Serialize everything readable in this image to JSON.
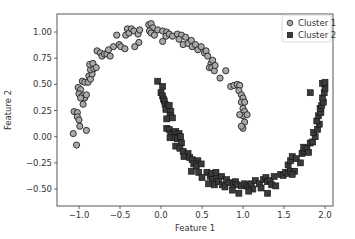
{
  "chart_data": {
    "type": "scatter",
    "title": "",
    "xlabel": "Feature 1",
    "ylabel": "Feature 2",
    "xlim": [
      -1.22,
      2.1
    ],
    "ylim": [
      -0.65,
      1.15
    ],
    "xticks": [
      -1.0,
      -0.5,
      0.0,
      0.5,
      1.0,
      1.5,
      2.0
    ],
    "xtick_labels": [
      "−1.0",
      "−0.5",
      "0.0",
      "0.5",
      "1.0",
      "1.5",
      "2.0"
    ],
    "yticks": [
      1.0,
      0.75,
      0.5,
      0.25,
      0.0,
      -0.25,
      -0.5
    ],
    "ytick_labels": [
      "1.00",
      "0.75",
      "0.50",
      "0.25",
      "0.00",
      "−0.25",
      "−0.50"
    ],
    "grid": false,
    "legend_position": "upper right",
    "series": [
      {
        "name": "Cluster 1",
        "marker": "circle",
        "color": "#a9a9a9",
        "edgecolor": "#222222",
        "points": [
          [
            -1.06,
            0.24
          ],
          [
            -1.02,
            0.23
          ],
          [
            -1.02,
            0.19
          ],
          [
            -1.0,
            0.16
          ],
          [
            -0.99,
            0.1
          ],
          [
            -1.07,
            0.03
          ],
          [
            -1.03,
            -0.08
          ],
          [
            -0.91,
            0.06
          ],
          [
            -1.01,
            0.47
          ],
          [
            -0.98,
            0.45
          ],
          [
            -1.0,
            0.41
          ],
          [
            -0.96,
            0.39
          ],
          [
            -0.93,
            0.37
          ],
          [
            -0.98,
            0.37
          ],
          [
            -0.91,
            0.4
          ],
          [
            -0.95,
            0.31
          ],
          [
            -0.96,
            0.53
          ],
          [
            -0.93,
            0.52
          ],
          [
            -0.89,
            0.52
          ],
          [
            -0.88,
            0.58
          ],
          [
            -0.86,
            0.55
          ],
          [
            -0.84,
            0.6
          ],
          [
            -0.86,
            0.64
          ],
          [
            -0.82,
            0.65
          ],
          [
            -0.87,
            0.69
          ],
          [
            -0.83,
            0.7
          ],
          [
            -0.79,
            0.66
          ],
          [
            -0.78,
            0.82
          ],
          [
            -0.74,
            0.8
          ],
          [
            -0.72,
            0.77
          ],
          [
            -0.69,
            0.79
          ],
          [
            -0.66,
            0.79
          ],
          [
            -0.64,
            0.83
          ],
          [
            -0.62,
            0.77
          ],
          [
            -0.58,
            0.86
          ],
          [
            -0.54,
            0.97
          ],
          [
            -0.51,
            0.88
          ],
          [
            -0.49,
            0.86
          ],
          [
            -0.44,
            0.84
          ],
          [
            -0.43,
            0.97
          ],
          [
            -0.41,
            1.03
          ],
          [
            -0.39,
            0.99
          ],
          [
            -0.36,
            1.03
          ],
          [
            -0.33,
            1.01
          ],
          [
            -0.28,
            0.98
          ],
          [
            -0.26,
            1.02
          ],
          [
            -0.27,
            0.9
          ],
          [
            -0.32,
            0.86
          ],
          [
            -0.15,
            1.07
          ],
          [
            -0.12,
            1.08
          ],
          [
            -0.1,
            1.04
          ],
          [
            -0.14,
            1.01
          ],
          [
            -0.12,
            0.99
          ],
          [
            -0.08,
            0.97
          ],
          [
            -0.04,
            1.02
          ],
          [
            0.02,
            1.01
          ],
          [
            0.07,
            1.0
          ],
          [
            0.06,
            0.96
          ],
          [
            0.02,
            0.91
          ],
          [
            0.1,
            0.98
          ],
          [
            0.14,
            0.96
          ],
          [
            0.2,
            0.98
          ],
          [
            0.25,
            0.97
          ],
          [
            0.3,
            0.95
          ],
          [
            0.22,
            0.93
          ],
          [
            0.27,
            0.88
          ],
          [
            0.33,
            0.89
          ],
          [
            0.37,
            0.92
          ],
          [
            0.38,
            0.86
          ],
          [
            0.42,
            0.88
          ],
          [
            0.45,
            0.83
          ],
          [
            0.49,
            0.86
          ],
          [
            0.53,
            0.8
          ],
          [
            0.55,
            0.82
          ],
          [
            0.57,
            0.77
          ],
          [
            0.61,
            0.7
          ],
          [
            0.63,
            0.73
          ],
          [
            0.59,
            0.66
          ],
          [
            0.62,
            0.66
          ],
          [
            0.65,
            0.63
          ],
          [
            0.66,
            0.68
          ],
          [
            0.72,
            0.56
          ],
          [
            0.79,
            0.63
          ],
          [
            0.85,
            0.48
          ],
          [
            0.89,
            0.49
          ],
          [
            0.93,
            0.5
          ],
          [
            0.96,
            0.49
          ],
          [
            0.95,
            0.44
          ],
          [
            0.98,
            0.4
          ],
          [
            1.0,
            0.37
          ],
          [
            0.98,
            0.33
          ],
          [
            1.02,
            0.33
          ],
          [
            1.0,
            0.27
          ],
          [
            1.02,
            0.24
          ],
          [
            1.0,
            0.2
          ],
          [
            0.96,
            0.21
          ],
          [
            1.02,
            0.14
          ],
          [
            1.05,
            0.21
          ],
          [
            1.0,
            0.08
          ],
          [
            0.98,
            0.1
          ]
        ]
      },
      {
        "name": "Cluster 2",
        "marker": "square",
        "color": "#3a3a3a",
        "edgecolor": "#111111",
        "points": [
          [
            -0.04,
            0.53
          ],
          [
            0.02,
            0.48
          ],
          [
            0.0,
            0.42
          ],
          [
            0.02,
            0.39
          ],
          [
            0.03,
            0.36
          ],
          [
            0.04,
            0.34
          ],
          [
            0.05,
            0.31
          ],
          [
            0.08,
            0.29
          ],
          [
            0.06,
            0.26
          ],
          [
            0.1,
            0.3
          ],
          [
            0.12,
            0.24
          ],
          [
            0.11,
            0.2
          ],
          [
            0.07,
            0.17
          ],
          [
            0.14,
            0.18
          ],
          [
            0.07,
            0.08
          ],
          [
            0.1,
            0.07
          ],
          [
            0.15,
            0.04
          ],
          [
            0.12,
            0.02
          ],
          [
            0.18,
            0.05
          ],
          [
            0.22,
            0.03
          ],
          [
            0.11,
            -0.01
          ],
          [
            0.17,
            -0.01
          ],
          [
            0.2,
            -0.02
          ],
          [
            0.24,
            0.0
          ],
          [
            0.25,
            -0.06
          ],
          [
            0.18,
            -0.09
          ],
          [
            0.23,
            -0.11
          ],
          [
            0.27,
            -0.14
          ],
          [
            0.33,
            -0.16
          ],
          [
            0.28,
            -0.19
          ],
          [
            0.35,
            -0.2
          ],
          [
            0.38,
            -0.22
          ],
          [
            0.45,
            -0.23
          ],
          [
            0.4,
            -0.26
          ],
          [
            0.43,
            -0.28
          ],
          [
            0.49,
            -0.26
          ],
          [
            0.37,
            -0.33
          ],
          [
            0.46,
            -0.34
          ],
          [
            0.56,
            -0.34
          ],
          [
            0.5,
            -0.39
          ],
          [
            0.6,
            -0.38
          ],
          [
            0.63,
            -0.41
          ],
          [
            0.62,
            -0.35
          ],
          [
            0.68,
            -0.4
          ],
          [
            0.67,
            -0.34
          ],
          [
            0.74,
            -0.38
          ],
          [
            0.58,
            -0.45
          ],
          [
            0.65,
            -0.46
          ],
          [
            0.7,
            -0.43
          ],
          [
            0.75,
            -0.46
          ],
          [
            0.8,
            -0.41
          ],
          [
            0.78,
            -0.48
          ],
          [
            0.84,
            -0.44
          ],
          [
            0.88,
            -0.45
          ],
          [
            0.91,
            -0.43
          ],
          [
            0.93,
            -0.46
          ],
          [
            0.87,
            -0.51
          ],
          [
            0.95,
            -0.54
          ],
          [
            0.98,
            -0.47
          ],
          [
            1.02,
            -0.45
          ],
          [
            1.05,
            -0.47
          ],
          [
            1.08,
            -0.48
          ],
          [
            1.1,
            -0.45
          ],
          [
            1.12,
            -0.5
          ],
          [
            1.07,
            -0.52
          ],
          [
            1.15,
            -0.42
          ],
          [
            1.2,
            -0.45
          ],
          [
            1.22,
            -0.49
          ],
          [
            1.25,
            -0.41
          ],
          [
            1.28,
            -0.39
          ],
          [
            1.3,
            -0.43
          ],
          [
            1.33,
            -0.42
          ],
          [
            1.35,
            -0.46
          ],
          [
            1.3,
            -0.54
          ],
          [
            1.4,
            -0.47
          ],
          [
            1.38,
            -0.38
          ],
          [
            1.46,
            -0.36
          ],
          [
            1.49,
            -0.37
          ],
          [
            1.52,
            -0.34
          ],
          [
            1.55,
            -0.35
          ],
          [
            1.58,
            -0.33
          ],
          [
            1.63,
            -0.33
          ],
          [
            1.6,
            -0.36
          ],
          [
            1.55,
            -0.27
          ],
          [
            1.58,
            -0.23
          ],
          [
            1.6,
            -0.19
          ],
          [
            1.65,
            -0.21
          ],
          [
            1.7,
            -0.25
          ],
          [
            1.72,
            -0.16
          ],
          [
            1.75,
            -0.14
          ],
          [
            1.74,
            -0.1
          ],
          [
            1.78,
            -0.11
          ],
          [
            1.8,
            -0.15
          ],
          [
            1.82,
            -0.06
          ],
          [
            1.85,
            -0.05
          ],
          [
            1.88,
            0.0
          ],
          [
            1.86,
            0.04
          ],
          [
            1.91,
            0.07
          ],
          [
            1.93,
            0.12
          ],
          [
            1.9,
            0.15
          ],
          [
            1.92,
            0.2
          ],
          [
            1.95,
            0.23
          ],
          [
            1.94,
            0.27
          ],
          [
            1.96,
            0.3
          ],
          [
            1.98,
            0.33
          ],
          [
            1.97,
            0.37
          ],
          [
            1.99,
            0.42
          ],
          [
            2.0,
            0.46
          ],
          [
            1.97,
            0.51
          ],
          [
            2.0,
            0.52
          ],
          [
            1.82,
            0.42
          ]
        ]
      }
    ]
  },
  "legend": {
    "items": [
      {
        "label": "Cluster 1",
        "marker": "circle"
      },
      {
        "label": "Cluster 2",
        "marker": "square"
      }
    ]
  },
  "axes": {
    "xlabel": "Feature 1",
    "ylabel": "Feature 2"
  }
}
